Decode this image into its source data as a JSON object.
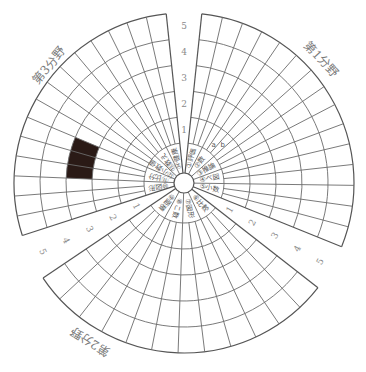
{
  "chart_data": {
    "type": "radial-segment-chart",
    "title": "",
    "levels": [
      1,
      2,
      3,
      4,
      5
    ],
    "scale_labels": [
      "1",
      "2",
      "3",
      "4",
      "5"
    ],
    "fields": [
      {
        "name": "第1分野",
        "position": "upper-right"
      },
      {
        "name": "第2分野",
        "position": "bottom"
      },
      {
        "name": "第3分野",
        "position": "upper-left"
      }
    ],
    "sector_labels": [
      "①評価",
      "②数",
      "③推論",
      "④ベ図",
      "⑤小数",
      "⑥比較",
      "⑦図形",
      "⑧こ数",
      "⑨面積",
      "⑩図形",
      "⑪比分",
      "⑫小数値",
      "⑬数え",
      "⑭健康"
    ],
    "sub_labels": [
      "a",
      "b"
    ],
    "filled_cells": [
      {
        "field": "第3分野",
        "sector_index_from_top_ccw": 3,
        "level": 3,
        "color": "#2a1a16"
      }
    ],
    "grid": true
  },
  "labels": {
    "field1": "第1分野",
    "field2": "第2分野",
    "field3": "第3分野",
    "a": "a",
    "b": "b"
  }
}
